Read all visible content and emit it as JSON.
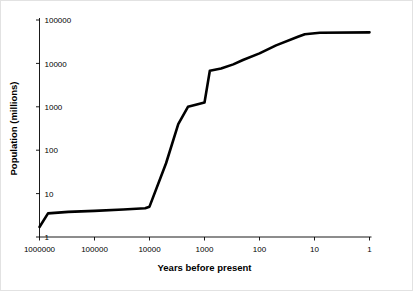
{
  "chart_data": {
    "type": "line",
    "title": "",
    "xlabel": "Years before present",
    "ylabel": "Population (millions)",
    "xscale": "log",
    "yscale": "log",
    "x_reversed": true,
    "xlim": [
      1000000,
      1
    ],
    "ylim": [
      1,
      100000
    ],
    "grid": false,
    "legend": false,
    "xticks": [
      1000000,
      100000,
      10000,
      1000,
      100,
      10,
      1
    ],
    "xtick_labels": [
      "1000000",
      "100000",
      "10000",
      "1000",
      "100",
      "10",
      "1"
    ],
    "yticks": [
      1,
      10,
      100,
      1000,
      10000,
      100000
    ],
    "ytick_labels": [
      "1",
      "10",
      "100",
      "1000",
      "10000",
      "100000"
    ],
    "series": [
      {
        "name": "World population",
        "color": "#000000",
        "x": [
          1000000,
          700000,
          300000,
          100000,
          30000,
          12000,
          10000,
          5000,
          3000,
          2000,
          1500,
          1000,
          800,
          500,
          300,
          200,
          100,
          50,
          20,
          15,
          8,
          1
        ],
        "y": [
          1.7,
          3.5,
          3.8,
          4.0,
          4.3,
          4.6,
          5.0,
          50,
          400,
          1000,
          1100,
          1250,
          6800,
          7600,
          9500,
          12000,
          17000,
          26000,
          41000,
          47000,
          51000,
          52000
        ]
      }
    ]
  },
  "axis_labels": {
    "x_title": "Years before present",
    "y_title": "Population (millions)"
  },
  "colors": {
    "line": "#000000",
    "axis": "#000000",
    "background": "#ffffff",
    "border": "#e2e2e2"
  }
}
